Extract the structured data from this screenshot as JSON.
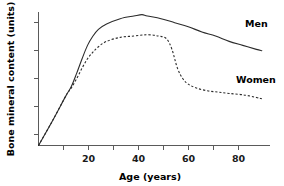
{
  "chart_data": {
    "type": "line",
    "title": "",
    "xlabel": "Age (years)",
    "ylabel": "Bone mineral content (units)",
    "xlim": [
      0,
      85
    ],
    "ylim": [
      0,
      100
    ],
    "grid": false,
    "legend_position": "inline-right",
    "x_ticks": [
      0,
      10,
      20,
      30,
      40,
      50,
      60,
      70,
      80
    ],
    "x_tick_labels": [
      "",
      "",
      "20",
      "",
      "40",
      "",
      "60",
      "",
      "80"
    ],
    "y_ticks": [
      0,
      20,
      40,
      60,
      80,
      100
    ],
    "y_tick_labels": [
      "",
      "",
      "",
      "",
      "",
      ""
    ],
    "series": [
      {
        "name": "Men",
        "style": "solid",
        "color": "#2b2b2b",
        "x": [
          0,
          5,
          10,
          12,
          14,
          16,
          18,
          20,
          22,
          25,
          30,
          35,
          38,
          40,
          45,
          50,
          55,
          60,
          65,
          70,
          75,
          80,
          82
        ],
        "values": [
          0,
          18,
          37,
          44,
          54,
          65,
          75,
          82,
          87,
          91,
          95,
          97,
          98,
          97,
          95,
          92,
          89,
          85,
          82,
          78,
          75,
          72,
          71
        ]
      },
      {
        "name": "Women",
        "style": "dashed",
        "color": "#2b2b2b",
        "x": [
          0,
          5,
          10,
          12,
          14,
          16,
          18,
          20,
          22,
          25,
          30,
          35,
          40,
          44,
          47,
          49,
          51,
          53,
          55,
          58,
          62,
          66,
          70,
          75,
          80,
          82
        ],
        "values": [
          0,
          18,
          37,
          43,
          50,
          58,
          65,
          70,
          74,
          78,
          81,
          82,
          83,
          82,
          80,
          72,
          58,
          50,
          46,
          43,
          41,
          40,
          39,
          38,
          36,
          35
        ]
      }
    ],
    "annotations": [
      {
        "text": "Men",
        "x": 84,
        "y": 84
      },
      {
        "text": "Women",
        "x": 80,
        "y": 46
      }
    ]
  },
  "labels": {
    "men": "Men",
    "women": "Women",
    "x_axis_title": "Age (years)",
    "y_axis_title": "Bone mineral content (units)",
    "x_20": "20",
    "x_40": "40",
    "x_60": "60",
    "x_80": "80"
  }
}
